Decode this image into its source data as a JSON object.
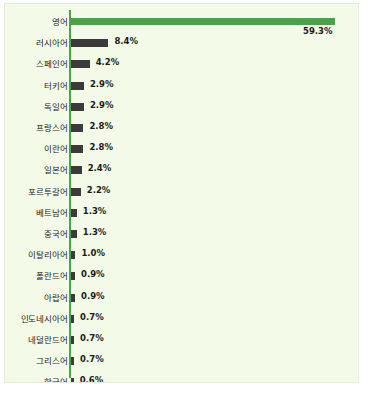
{
  "chart_data": {
    "type": "bar",
    "orientation": "horizontal",
    "title": "",
    "subtitle": "",
    "xlabel": "",
    "ylabel": "",
    "grid": false,
    "legend": false,
    "xlim": [
      0,
      59.3
    ],
    "value_suffix": "%",
    "accent_color": "#4aa34a",
    "bar_color": "#3b3b3b",
    "axis_color": "#4da34d",
    "background_color": "#f3fae7",
    "categories": [
      "영어",
      "러시아어",
      "스페인어",
      "터키어",
      "독일어",
      "프랑스어",
      "이란어",
      "일본어",
      "포르투갈어",
      "베트남어",
      "중국어",
      "이탈리아어",
      "폴란드어",
      "아랍어",
      "인도네시아어",
      "네덜란드어",
      "그리스어",
      "한국어"
    ],
    "values": [
      59.3,
      8.4,
      4.2,
      2.9,
      2.9,
      2.8,
      2.8,
      2.4,
      2.2,
      1.3,
      1.3,
      1.0,
      0.9,
      0.9,
      0.7,
      0.7,
      0.7,
      0.6
    ],
    "labels": [
      "59.3%",
      "8.4%",
      "4.2%",
      "2.9%",
      "2.9%",
      "2.8%",
      "2.8%",
      "2.4%",
      "2.2%",
      "1.3%",
      "1.3%",
      "1.0%",
      "0.9%",
      "0.9%",
      "0.7%",
      "0.7%",
      "0.7%",
      "0.6%"
    ],
    "bars": [
      {
        "category": "영어",
        "value": 59.3,
        "label": "59.3%",
        "highlight": true,
        "label_position": "below"
      },
      {
        "category": "러시아어",
        "value": 8.4,
        "label": "8.4%",
        "highlight": false,
        "label_position": "right"
      },
      {
        "category": "스페인어",
        "value": 4.2,
        "label": "4.2%",
        "highlight": false,
        "label_position": "right"
      },
      {
        "category": "터키어",
        "value": 2.9,
        "label": "2.9%",
        "highlight": false,
        "label_position": "right"
      },
      {
        "category": "독일어",
        "value": 2.9,
        "label": "2.9%",
        "highlight": false,
        "label_position": "right"
      },
      {
        "category": "프랑스어",
        "value": 2.8,
        "label": "2.8%",
        "highlight": false,
        "label_position": "right"
      },
      {
        "category": "이란어",
        "value": 2.8,
        "label": "2.8%",
        "highlight": false,
        "label_position": "right"
      },
      {
        "category": "일본어",
        "value": 2.4,
        "label": "2.4%",
        "highlight": false,
        "label_position": "right"
      },
      {
        "category": "포르투갈어",
        "value": 2.2,
        "label": "2.2%",
        "highlight": false,
        "label_position": "right"
      },
      {
        "category": "베트남어",
        "value": 1.3,
        "label": "1.3%",
        "highlight": false,
        "label_position": "right"
      },
      {
        "category": "중국어",
        "value": 1.3,
        "label": "1.3%",
        "highlight": false,
        "label_position": "right"
      },
      {
        "category": "이탈리아어",
        "value": 1.0,
        "label": "1.0%",
        "highlight": false,
        "label_position": "right"
      },
      {
        "category": "폴란드어",
        "value": 0.9,
        "label": "0.9%",
        "highlight": false,
        "label_position": "right"
      },
      {
        "category": "아랍어",
        "value": 0.9,
        "label": "0.9%",
        "highlight": false,
        "label_position": "right"
      },
      {
        "category": "인도네시아어",
        "value": 0.7,
        "label": "0.7%",
        "highlight": false,
        "label_position": "right"
      },
      {
        "category": "네덜란드어",
        "value": 0.7,
        "label": "0.7%",
        "highlight": false,
        "label_position": "right"
      },
      {
        "category": "그리스어",
        "value": 0.7,
        "label": "0.7%",
        "highlight": false,
        "label_position": "right"
      },
      {
        "category": "한국어",
        "value": 0.6,
        "label": "0.6%",
        "highlight": false,
        "label_position": "right"
      }
    ]
  }
}
